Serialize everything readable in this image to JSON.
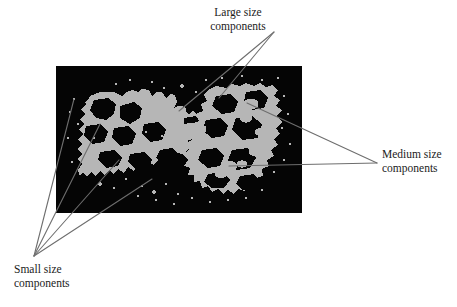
{
  "figure": {
    "type": "annotated-binary-image",
    "background_color": "#ffffff",
    "panel": {
      "name": "segmented-binary-image",
      "background_color": "#050505",
      "foreground_color": "#b6b6b6",
      "x": 56,
      "y": 66,
      "width": 246,
      "height": 147
    }
  },
  "callouts": [
    {
      "id": "large",
      "line1": "Large size",
      "line2": "components",
      "anchor": {
        "x": 274,
        "y": 32
      },
      "targets": [
        {
          "x": 179,
          "y": 111
        },
        {
          "x": 219,
          "y": 98
        }
      ]
    },
    {
      "id": "medium",
      "line1": "Medium size",
      "line2": "components",
      "anchor": {
        "x": 377,
        "y": 163
      },
      "targets": [
        {
          "x": 247,
          "y": 103
        },
        {
          "x": 229,
          "y": 166
        }
      ]
    },
    {
      "id": "small",
      "line1": "Small size",
      "line2": "components",
      "anchor": {
        "x": 34,
        "y": 256
      },
      "targets": [
        {
          "x": 74,
          "y": 99
        },
        {
          "x": 100,
          "y": 124
        },
        {
          "x": 119,
          "y": 160
        },
        {
          "x": 152,
          "y": 179
        }
      ]
    }
  ],
  "style": {
    "leader_line_color": "#6e6e6e",
    "leader_line_width": 1.1,
    "text_color": "#1b1b1b"
  }
}
